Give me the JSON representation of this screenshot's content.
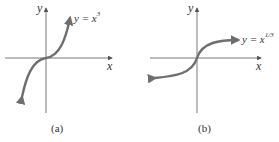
{
  "panels": [
    {
      "id": "a",
      "caption": "(a)",
      "equation": {
        "prefix": "y = x",
        "exponent": "3"
      },
      "x_label": "x",
      "y_label": "y"
    },
    {
      "id": "b",
      "caption": "(b)",
      "equation": {
        "prefix": "y = x",
        "exponent": "1/3"
      },
      "x_label": "x",
      "y_label": "y"
    }
  ],
  "colors": {
    "axis": "#555555",
    "curve": "#6e6e6e",
    "text": "#333333"
  }
}
